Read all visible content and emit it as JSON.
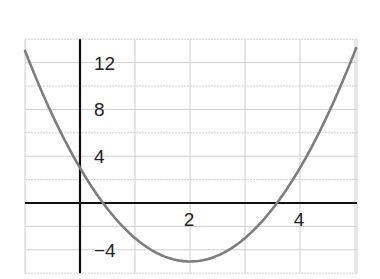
{
  "chart_data": {
    "type": "line",
    "title": "",
    "xlabel": "",
    "ylabel": "",
    "function": "y = 2x^2 - 8x + 3",
    "xlim": [
      -1,
      5.05
    ],
    "ylim": [
      -6,
      14
    ],
    "grid": true,
    "x_gridlines": [
      -1,
      0,
      1,
      2,
      3,
      4,
      5
    ],
    "y_gridlines": [
      -6,
      -4,
      -2,
      0,
      2,
      4,
      6,
      8,
      10,
      12,
      14
    ],
    "x_tick_labels": [
      {
        "value": 2,
        "label": "2"
      },
      {
        "value": 4,
        "label": "4"
      }
    ],
    "y_tick_labels": [
      {
        "value": 12,
        "label": "12"
      },
      {
        "value": 8,
        "label": "8"
      },
      {
        "value": 4,
        "label": "4"
      },
      {
        "value": -4,
        "label": "−4"
      }
    ],
    "series": [
      {
        "name": "parabola",
        "x": [
          -1,
          -0.5,
          0,
          0.5,
          1,
          1.5,
          2,
          2.5,
          3,
          3.5,
          4,
          4.5,
          5
        ],
        "values": [
          13,
          7.5,
          3,
          -0.5,
          -3,
          -4.5,
          -5,
          -4.5,
          -3,
          -0.5,
          3,
          7.5,
          13
        ]
      }
    ],
    "vertex": [
      2,
      -5
    ],
    "roots": [
      0.42,
      3.58
    ],
    "y_intercept": 3,
    "colors": {
      "curve": "#7d7d7d",
      "axes": "#111111",
      "grid": "#cfcfcf"
    }
  }
}
